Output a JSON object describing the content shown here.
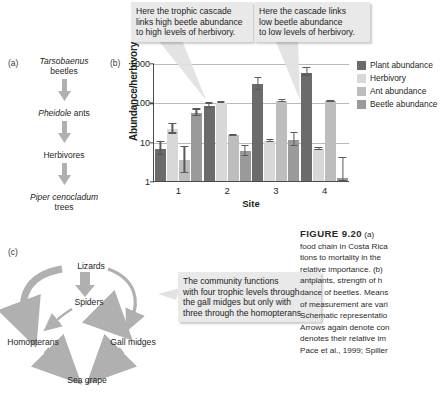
{
  "figure": {
    "number_label": "FIGURE 9.20",
    "caption_lines": [
      "(a)",
      "food chain in Costa Rica",
      "tions to mortality in the",
      "relative importance. (b)",
      "antplants, strength of h",
      "dance of beetles. Means",
      "of measurement are vari",
      "Schematic representatio",
      "Arrows again denote con",
      "denotes their relative im",
      "Pace et al., 1999; Spiller"
    ]
  },
  "panel_a": {
    "tag": "(a)",
    "nodes": [
      {
        "italic": "Tarsobaenus",
        "plain": "beetles"
      },
      {
        "italic": "Pheidole",
        "plain": "ants"
      },
      {
        "italic": "",
        "plain": "Herbivores"
      },
      {
        "italic": "Piper cenocladum",
        "plain": "trees"
      }
    ]
  },
  "panel_b": {
    "tag": "(b)"
  },
  "panel_c": {
    "tag": "(c)",
    "nodes": {
      "lizards": "Lizards",
      "spiders": "Spiders",
      "homopterans": "Homopterans",
      "gall_midges": "Gall midges",
      "sea_grape": "Sea grape"
    }
  },
  "callouts": [
    {
      "id": "callout-1",
      "lines": [
        "Here the trophic cascade",
        "links high beetle abundance",
        "to high levels of herbivory."
      ]
    },
    {
      "id": "callout-2",
      "lines": [
        "Here the cascade links",
        "low beetle abundance",
        "to low levels of herbivory."
      ]
    },
    {
      "id": "callout-3",
      "lines": [
        "The community functions",
        "with four trophic levels through",
        "the gall midges but only with",
        "three through the homopterans"
      ]
    }
  ],
  "chart_data": {
    "type": "bar",
    "title": "",
    "xlabel": "Site",
    "ylabel": "Abundance/herbivory",
    "categories": [
      "1",
      "2",
      "3",
      "4"
    ],
    "yscale": "log",
    "ylim": [
      1,
      1000
    ],
    "yticks": [
      "1",
      "10",
      "100",
      "1000"
    ],
    "grid": true,
    "legend_position": "right",
    "series": [
      {
        "name": "Plant abundance",
        "color": "#6b6b6b",
        "values": [
          6.5,
          85,
          300,
          600
        ],
        "err_low": [
          4.5,
          72,
          205,
          480
        ],
        "err_high": [
          10.5,
          100,
          440,
          780
        ]
      },
      {
        "name": "Herbivory",
        "color": "#d8d8d8",
        "values": [
          21,
          100,
          10.5,
          6.5
        ],
        "err_low": [
          16,
          97,
          9.6,
          6.0
        ],
        "err_high": [
          30,
          104,
          11.5,
          7.2
        ]
      },
      {
        "name": "Ant abundance",
        "color": "#bdbdbd",
        "values": [
          3.5,
          15,
          110,
          110
        ],
        "err_low": [
          1.6,
          14.3,
          100,
          102
        ],
        "err_high": [
          8.0,
          15.8,
          122,
          118
        ]
      },
      {
        "name": "Beetle abundance",
        "color": "#9a9a9a",
        "values": [
          55,
          5.8,
          11,
          1.2
        ],
        "err_low": [
          44,
          4.3,
          7.6,
          1.0
        ],
        "err_high": [
          70,
          8.3,
          17.5,
          4.2
        ]
      }
    ]
  },
  "colors": {
    "arrow": "#b0b0b0",
    "callout_bg": "#e9e9e9",
    "axis": "#4a4a4a",
    "grid": "#b9b9b9"
  }
}
